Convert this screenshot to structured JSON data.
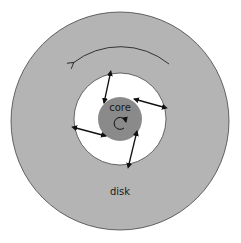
{
  "diagram": {
    "type": "accretion-disk-schematic",
    "labels": {
      "core": "core",
      "disk": "disk"
    },
    "colors": {
      "background": "#ffffff",
      "disk_fill": "#b4b4b4",
      "disk_outline": "#444444",
      "gap_fill": "#ffffff",
      "core_fill": "#8a8a8a",
      "arrow": "#111111"
    },
    "elements": {
      "disk": {
        "cx": 120,
        "cy": 121,
        "r": 109
      },
      "gap": {
        "cx": 120,
        "cy": 119,
        "r": 46
      },
      "core": {
        "cx": 120,
        "cy": 119,
        "r": 22
      },
      "rotation_arrow": {
        "direction": "counter-clockwise"
      },
      "core_spin_arrow": {
        "direction": "clockwise"
      },
      "connection_arrows": [
        {
          "from": [
            110,
            75
          ],
          "to": [
            104,
            103
          ]
        },
        {
          "from": [
            163,
            107
          ],
          "to": [
            134,
            99
          ]
        },
        {
          "from": [
            129,
            164
          ],
          "to": [
            137,
            131
          ]
        },
        {
          "from": [
            76,
            128
          ],
          "to": [
            106,
            136
          ]
        }
      ]
    }
  }
}
